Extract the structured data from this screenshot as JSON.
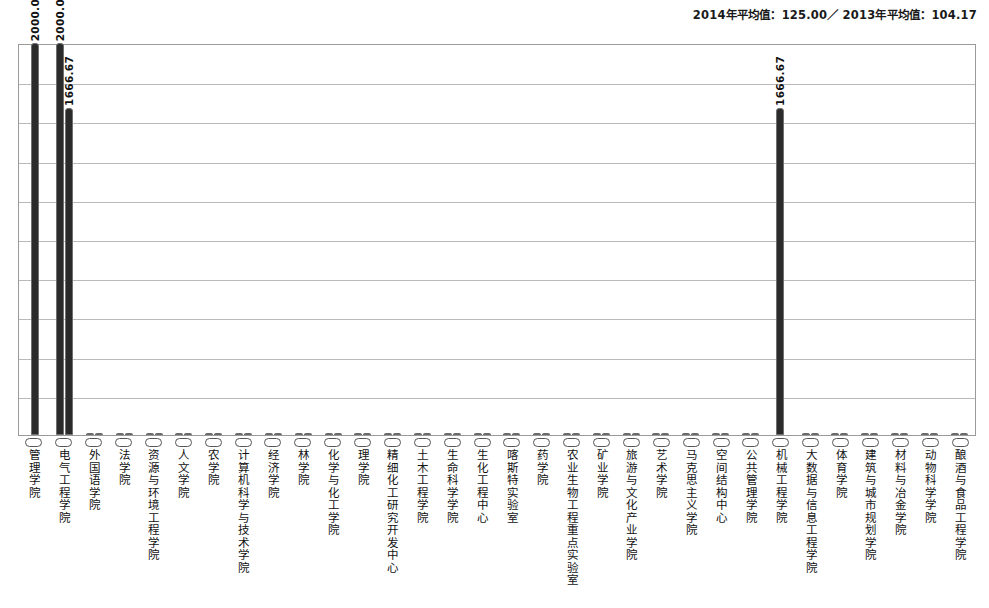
{
  "header": {
    "note": "2014年平均值：125.00／ 2013年平均值：104.17"
  },
  "chart_data": {
    "type": "bar",
    "title": "",
    "xlabel": "",
    "ylabel": "",
    "ylim": [
      0,
      2000
    ],
    "grid": true,
    "gridline_count": 10,
    "legend": "none",
    "categories": [
      "管理学院",
      "电气工程学院",
      "外国语学院",
      "法学院",
      "资源与环境工程学院",
      "人文学院",
      "农学院",
      "计算机科学与技术学院",
      "经济学院",
      "林学院",
      "化学与化工学院",
      "理学院",
      "精细化工研究开发中心",
      "土木工程学院",
      "生命科学学院",
      "生化工程中心",
      "喀斯特实验室",
      "药学院",
      "农业生物工程重点实验室",
      "矿业学院",
      "旅游与文化产业学院",
      "艺术学院",
      "马克思主义学院",
      "空间结构中心",
      "公共管理学院",
      "机械工程学院",
      "大数据与信息工程学院",
      "体育学院",
      "建筑与城市规划学院",
      "材料与冶金学院",
      "动物科学学院",
      "酿酒与食品工程学院"
    ],
    "series": [
      {
        "name": "2014",
        "values": [
          2000.0,
          2000.0,
          10,
          10,
          10,
          10,
          10,
          10,
          10,
          10,
          10,
          10,
          10,
          10,
          10,
          10,
          10,
          10,
          10,
          10,
          10,
          10,
          10,
          10,
          10,
          1666.67,
          10,
          10,
          10,
          10,
          10,
          10
        ]
      },
      {
        "name": "2013",
        "values": [
          0,
          1666.67,
          10,
          10,
          10,
          10,
          10,
          10,
          10,
          10,
          10,
          10,
          10,
          10,
          10,
          10,
          10,
          10,
          10,
          10,
          10,
          10,
          10,
          10,
          10,
          0,
          10,
          10,
          10,
          10,
          10,
          10
        ]
      }
    ],
    "data_labels": [
      {
        "category_index": 0,
        "series_index": 0,
        "text": "2000.0"
      },
      {
        "category_index": 1,
        "series_index": 0,
        "text": "2000.0"
      },
      {
        "category_index": 1,
        "series_index": 1,
        "text": "1666.67"
      },
      {
        "category_index": 25,
        "series_index": 0,
        "text": "1666.67"
      }
    ],
    "colors": {
      "bar_fill": "#2b2b2b",
      "bar_border": "#707070",
      "small_bar_fill": "#f2f2f2",
      "gridline": "#b9b9b9",
      "frame": "#9a9a9a",
      "text": "#121212"
    }
  }
}
